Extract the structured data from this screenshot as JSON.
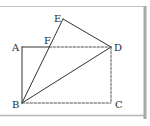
{
  "figure": {
    "type": "geometry-diagram",
    "frame": {
      "top_line_y": 6.5,
      "bottom_line_y": 115.5,
      "right_bar_x": 145,
      "line_color": "#b8b8b8",
      "bar_color": "#a9a9a9"
    },
    "points": {
      "A": {
        "label": "A",
        "x": 22,
        "y": 47,
        "label_x": 12,
        "label_y": 51
      },
      "F": {
        "label": "F",
        "x": 49,
        "y": 47,
        "label_x": 44,
        "label_y": 44
      },
      "E": {
        "label": "E",
        "x": 63,
        "y": 19,
        "label_x": 54,
        "label_y": 22
      },
      "D": {
        "label": "D",
        "x": 111,
        "y": 47,
        "label_x": 114,
        "label_y": 51
      },
      "B": {
        "label": "B",
        "x": 22,
        "y": 103,
        "label_x": 12,
        "label_y": 108
      },
      "C": {
        "label": "C",
        "x": 111,
        "y": 103,
        "label_x": 115,
        "label_y": 108
      }
    },
    "segments": [
      {
        "from": "A",
        "to": "F",
        "style": "solid"
      },
      {
        "from": "A",
        "to": "B",
        "style": "solid"
      },
      {
        "from": "B",
        "to": "E",
        "style": "solid"
      },
      {
        "from": "E",
        "to": "D",
        "style": "solid"
      },
      {
        "from": "B",
        "to": "D",
        "style": "solid"
      },
      {
        "from": "F",
        "to": "D",
        "style": "dashed"
      },
      {
        "from": "D",
        "to": "C",
        "style": "dashed"
      },
      {
        "from": "B",
        "to": "C",
        "style": "dashed"
      }
    ],
    "colors": {
      "stroke": "#333333",
      "dashed_stroke": "#555555",
      "label": "#2a2a2a"
    }
  }
}
